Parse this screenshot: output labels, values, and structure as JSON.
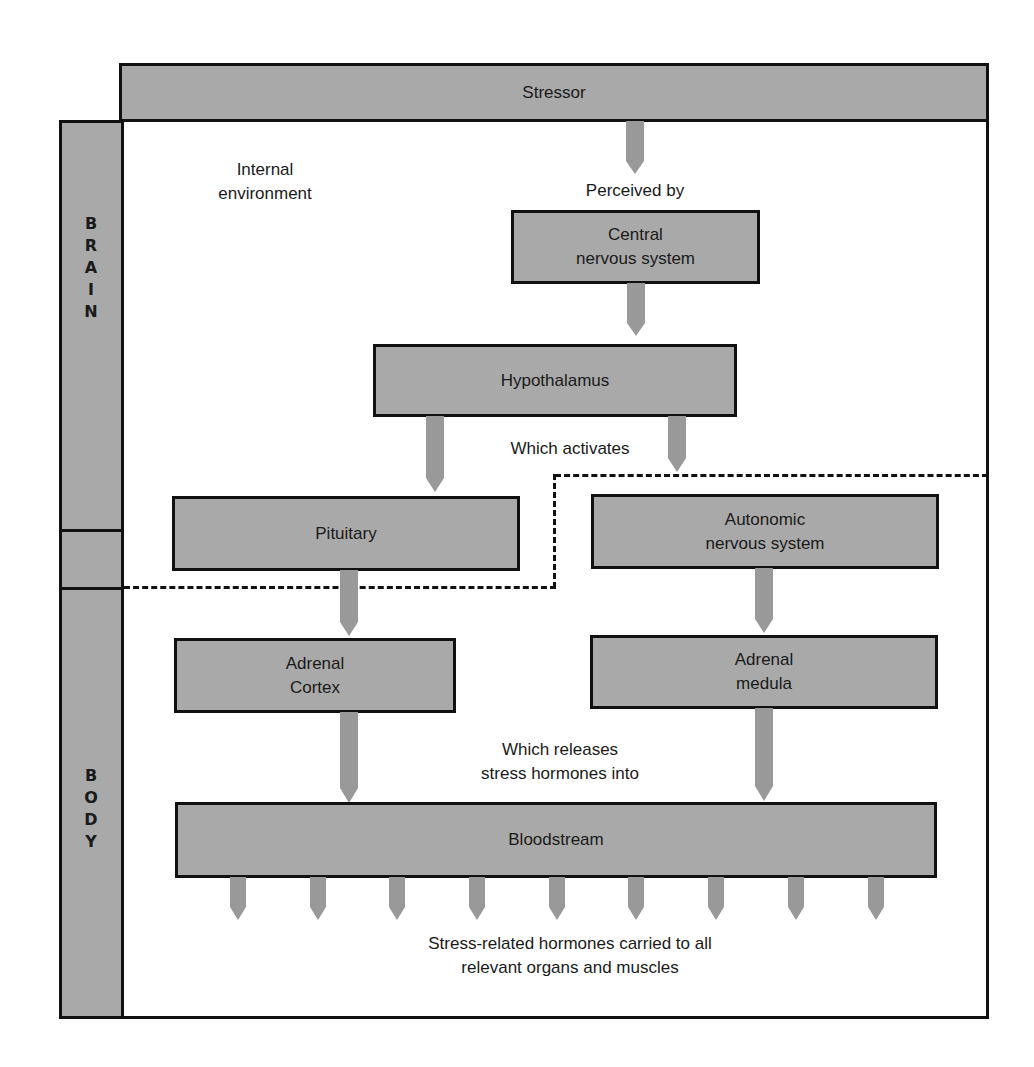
{
  "diagram": {
    "title": "Stressor",
    "internal_label": "Internal\nenvironment",
    "side_labels": {
      "brain": "B\nR\nA\nI\nN",
      "body": "B\nO\nD\nY"
    },
    "nodes": {
      "cns": "Central\nnervous system",
      "hypothalamus": "Hypothalamus",
      "pituitary": "Pituitary",
      "autonomic": "Autonomic\nnervous system",
      "adrenal_cortex": "Adrenal\nCortex",
      "adrenal_medula": "Adrenal\nmedula",
      "bloodstream": "Bloodstream"
    },
    "edge_labels": {
      "perceived_by": "Perceived by",
      "which_activates": "Which activates",
      "which_releases": "Which releases\nstress hormones into",
      "outcome": "Stress-related hormones carried to all\nrelevant organs and muscles"
    },
    "edges": [
      {
        "from": "Stressor",
        "to": "Central nervous system",
        "label": "Perceived by"
      },
      {
        "from": "Central nervous system",
        "to": "Hypothalamus"
      },
      {
        "from": "Hypothalamus",
        "to": "Pituitary",
        "label": "Which activates"
      },
      {
        "from": "Hypothalamus",
        "to": "Autonomic nervous system",
        "label": "Which activates"
      },
      {
        "from": "Pituitary",
        "to": "Adrenal Cortex"
      },
      {
        "from": "Autonomic nervous system",
        "to": "Adrenal medula"
      },
      {
        "from": "Adrenal Cortex",
        "to": "Bloodstream",
        "label": "Which releases stress hormones into"
      },
      {
        "from": "Adrenal medula",
        "to": "Bloodstream",
        "label": "Which releases stress hormones into"
      },
      {
        "from": "Bloodstream",
        "to": "relevant organs and muscles",
        "count": 9
      }
    ],
    "colors": {
      "box_fill": "#a9a9a9",
      "arrow_fill": "#999999",
      "border": "#111111"
    }
  }
}
